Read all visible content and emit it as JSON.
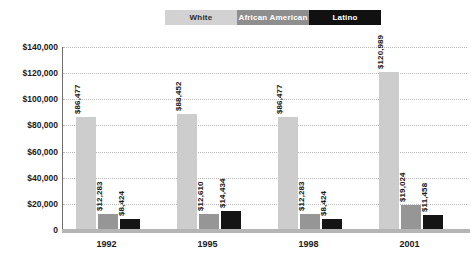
{
  "chart_data": {
    "type": "bar",
    "title": "",
    "subtitle": "",
    "xlabel": "",
    "ylabel": "",
    "categories": [
      "1992",
      "1995",
      "1998",
      "2001"
    ],
    "series": [
      {
        "name": "White",
        "color": "#cdcdcd",
        "values": [
          86477,
          88452,
          86477,
          120989
        ],
        "labels": [
          "$86,477",
          "$88,452",
          "$86,477",
          "$120,989"
        ]
      },
      {
        "name": "African American",
        "color": "#969696",
        "values": [
          12283,
          12610,
          12283,
          19024
        ],
        "labels": [
          "$12,283",
          "$12,610",
          "$12,283",
          "$19,024"
        ]
      },
      {
        "name": "Latino",
        "color": "#141414",
        "values": [
          8424,
          14434,
          8424,
          11458
        ],
        "labels": [
          "$8,424",
          "$14,434",
          "$8,424",
          "$11,458"
        ]
      }
    ],
    "ylim": [
      0,
      140000
    ],
    "ytick_values": [
      0,
      20000,
      40000,
      60000,
      80000,
      100000,
      120000,
      140000
    ],
    "ytick_labels": [
      "0",
      "$20,000",
      "$40,000",
      "$60,000",
      "$80,000",
      "$100,000",
      "$120,000",
      "$140,000"
    ],
    "grid": true,
    "grid_style": "dotted-horizontal",
    "legend_position": "top-center"
  },
  "legend": {
    "items": [
      {
        "label": "White",
        "swatch": "#d2d2d2"
      },
      {
        "label": "African American",
        "swatch": "#8e8e8e"
      },
      {
        "label": "Latino",
        "swatch": "#111111"
      }
    ]
  }
}
